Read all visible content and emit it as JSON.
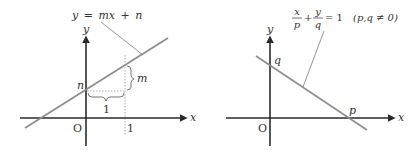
{
  "figures": [
    {
      "id": "slope-intercept",
      "equation": {
        "lhs": "y",
        "eq": "=",
        "rhs_a": "mx",
        "plus": "+",
        "rhs_b": "n"
      },
      "axis_x_label": "x",
      "axis_y_label": "y",
      "origin_label": "O",
      "x_tick_label": "1",
      "intercept_label": "n",
      "rise_label": "m",
      "run_label": "1"
    },
    {
      "id": "intercept-form",
      "equation": {
        "frac1_num": "x",
        "frac1_den": "p",
        "plus": "+",
        "frac2_num": "y",
        "frac2_den": "q",
        "eq_one": "= 1",
        "condition": "(p,q ≠ 0)"
      },
      "axis_x_label": "x",
      "axis_y_label": "y",
      "origin_label": "O",
      "x_intercept_label": "p",
      "y_intercept_label": "q"
    }
  ],
  "colors": {
    "axis": "#2a2a2a",
    "line": "#8c8c8c",
    "leader": "#7a7a7a",
    "dotted": "#9a9a9a",
    "text": "#333333"
  }
}
